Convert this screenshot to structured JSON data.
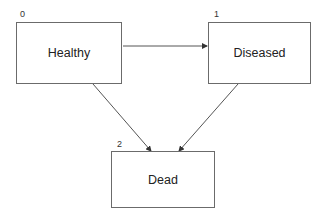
{
  "diagram": {
    "type": "state-transition",
    "states": [
      {
        "id": "0",
        "label": "Healthy"
      },
      {
        "id": "1",
        "label": "Diseased"
      },
      {
        "id": "2",
        "label": "Dead"
      }
    ],
    "transitions": [
      {
        "from": "Healthy",
        "to": "Diseased"
      },
      {
        "from": "Healthy",
        "to": "Dead"
      },
      {
        "from": "Diseased",
        "to": "Dead"
      }
    ],
    "colors": {
      "line": "#555555",
      "box_border": "#6b6b6b",
      "text": "#222222"
    }
  }
}
